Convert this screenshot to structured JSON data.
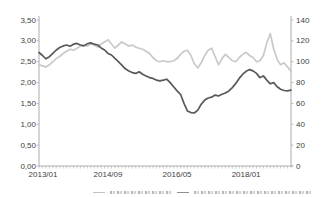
{
  "chart_data": {
    "type": "line",
    "title": "",
    "grid": false,
    "background": "#ffffff",
    "axis_color": "#adadad",
    "label_color": "#3f3f3f",
    "x": [
      "2013/01",
      "2013/02",
      "2013/03",
      "2013/04",
      "2013/05",
      "2013/06",
      "2013/07",
      "2013/08",
      "2013/09",
      "2013/10",
      "2013/11",
      "2013/12",
      "2014/01",
      "2014/02",
      "2014/03",
      "2014/04",
      "2014/05",
      "2014/06",
      "2014/07",
      "2014/08",
      "2014/09",
      "2014/10",
      "2014/11",
      "2014/12",
      "2015/01",
      "2015/02",
      "2015/03",
      "2015/04",
      "2015/05",
      "2015/06",
      "2015/07",
      "2015/08",
      "2015/09",
      "2015/10",
      "2015/11",
      "2015/12",
      "2016/01",
      "2016/02",
      "2016/03",
      "2016/04",
      "2016/05",
      "2016/06",
      "2016/07",
      "2016/08",
      "2016/09",
      "2016/10",
      "2016/11",
      "2016/12",
      "2017/01",
      "2017/02",
      "2017/03",
      "2017/04",
      "2017/05",
      "2017/06",
      "2017/07",
      "2017/08",
      "2017/09",
      "2017/10",
      "2017/11",
      "2017/12",
      "2018/01",
      "2018/02",
      "2018/03",
      "2018/04",
      "2018/05",
      "2018/06",
      "2018/07",
      "2018/08",
      "2018/09",
      "2018/10",
      "2018/11",
      "2018/12",
      "2019/01",
      "2019/02"
    ],
    "series": [
      {
        "name": "dark-series-left-axis",
        "axis": "left",
        "color": "#595959",
        "values": [
          2.72,
          2.65,
          2.57,
          2.62,
          2.7,
          2.78,
          2.84,
          2.88,
          2.9,
          2.87,
          2.92,
          2.94,
          2.9,
          2.88,
          2.93,
          2.95,
          2.92,
          2.9,
          2.83,
          2.78,
          2.7,
          2.66,
          2.58,
          2.5,
          2.42,
          2.33,
          2.28,
          2.24,
          2.22,
          2.26,
          2.2,
          2.16,
          2.12,
          2.1,
          2.06,
          2.04,
          2.06,
          2.08,
          2.0,
          1.9,
          1.8,
          1.72,
          1.5,
          1.32,
          1.28,
          1.27,
          1.34,
          1.48,
          1.58,
          1.63,
          1.65,
          1.7,
          1.68,
          1.72,
          1.75,
          1.8,
          1.88,
          1.98,
          2.1,
          2.2,
          2.27,
          2.31,
          2.28,
          2.22,
          2.12,
          2.16,
          2.06,
          1.97,
          2.0,
          1.9,
          1.84,
          1.81,
          1.8,
          1.82
        ]
      },
      {
        "name": "light-series-right-axis",
        "axis": "right",
        "color": "#c9c9c9",
        "values": [
          97,
          96,
          95,
          97,
          100,
          103,
          105,
          108,
          110,
          112,
          111,
          113,
          115,
          116,
          115,
          117,
          116,
          114,
          117,
          119,
          121,
          117,
          113,
          116,
          119,
          117,
          115,
          116,
          114,
          113,
          112,
          110,
          108,
          104,
          101,
          100,
          101,
          100,
          100,
          101,
          103,
          107,
          110,
          111,
          106,
          98,
          94,
          99,
          106,
          111,
          113,
          105,
          97,
          103,
          107,
          104,
          101,
          100,
          104,
          107,
          109,
          106,
          104,
          100,
          101,
          106,
          118,
          127,
          112,
          102,
          97,
          99,
          95,
          91
        ]
      }
    ],
    "left_axis": {
      "min": 0,
      "max": 3.5,
      "step": 0.5,
      "tick_labels": [
        "0,00",
        "0,50",
        "1,00",
        "1,50",
        "2,00",
        "2,50",
        "3,00",
        "3,50"
      ]
    },
    "right_axis": {
      "min": 0,
      "max": 140,
      "step": 20,
      "tick_labels": [
        "0",
        "20",
        "40",
        "60",
        "80",
        "100",
        "120",
        "140"
      ]
    },
    "x_axis": {
      "tick_labels": [
        "2013/01",
        "2014/09",
        "2016/05",
        "2018/01"
      ],
      "tick_indices": [
        0,
        20,
        40,
        60
      ],
      "minor_ticks": "monthly"
    },
    "legend": {
      "position": "bottom",
      "clipped": true,
      "text_legible": false
    }
  }
}
